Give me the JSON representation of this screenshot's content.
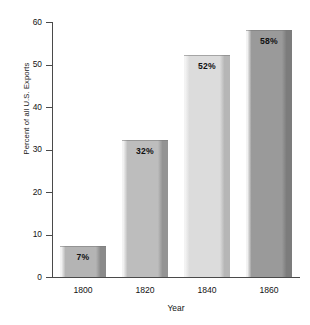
{
  "chart_data": {
    "type": "bar",
    "title": "",
    "subtitle": "",
    "xlabel": "Year",
    "ylabel": "Percent of all U.S. Exports",
    "categories": [
      "1800",
      "1820",
      "1840",
      "1860"
    ],
    "values": [
      7,
      32,
      52,
      58
    ],
    "data_labels": [
      "7%",
      "32%",
      "52%",
      "58%"
    ],
    "ylim": [
      0,
      60
    ],
    "ytick_labels": [
      "0",
      "10",
      "20",
      "30",
      "40",
      "50",
      "60"
    ],
    "ytick_values": [
      0,
      10,
      20,
      30,
      40,
      50,
      60
    ],
    "grid": false,
    "legend": null,
    "legend_position": "none",
    "annotations": [],
    "bar_colors": [
      "#b4b4b4",
      "#bdbdbd",
      "#dcdcdc",
      "#9a9a9a"
    ],
    "bar_edge_colors": [
      "#8a8a8a",
      "#949494",
      "#b6b6b6",
      "#7c7c7c"
    ],
    "axis_color": "#4a4a4a",
    "background_color": "#ffffff",
    "label_text_color": "#111111"
  }
}
